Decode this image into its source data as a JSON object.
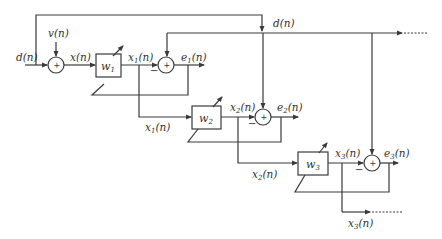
{
  "diagram": {
    "signals": {
      "input_desired": "d(n)",
      "noise": "v(n)",
      "filter_input": "x(n)",
      "desired_bus": "d(n)"
    },
    "stages": [
      {
        "filter": "w",
        "filter_sub": "1",
        "output": "x",
        "output_sub": "1",
        "error": "e",
        "error_sub": "1",
        "branch": "x",
        "branch_sub": "1"
      },
      {
        "filter": "w",
        "filter_sub": "2",
        "output": "x",
        "output_sub": "2",
        "error": "e",
        "error_sub": "2",
        "branch": "x",
        "branch_sub": "2"
      },
      {
        "filter": "w",
        "filter_sub": "3",
        "output": "x",
        "output_sub": "3",
        "error": "e",
        "error_sub": "3",
        "branch": "x",
        "branch_sub": "3"
      }
    ],
    "arg": "(n)",
    "summer_plus": "+",
    "summer_minus": "−"
  }
}
